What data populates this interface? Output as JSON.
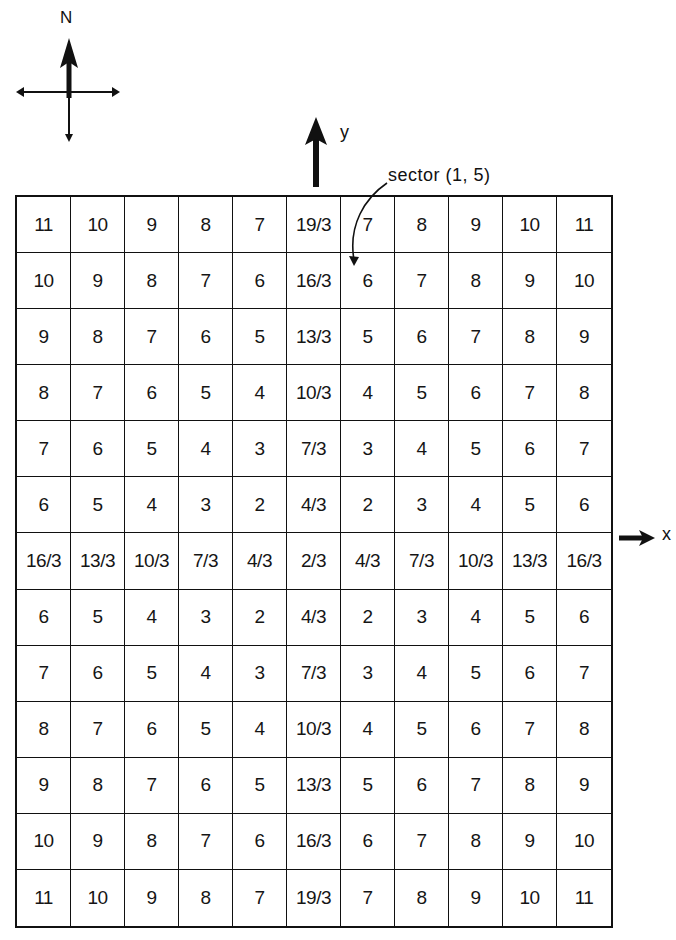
{
  "compass": {
    "north_label": "N"
  },
  "axes": {
    "y_label": "y",
    "x_label": "x"
  },
  "annotation": {
    "sector_label": "sector (1, 5)"
  },
  "grid": {
    "rows": 13,
    "cols": 11,
    "cells": [
      [
        "11",
        "10",
        "9",
        "8",
        "7",
        "19/3",
        "7",
        "8",
        "9",
        "10",
        "11"
      ],
      [
        "10",
        "9",
        "8",
        "7",
        "6",
        "16/3",
        "6",
        "7",
        "8",
        "9",
        "10"
      ],
      [
        "9",
        "8",
        "7",
        "6",
        "5",
        "13/3",
        "5",
        "6",
        "7",
        "8",
        "9"
      ],
      [
        "8",
        "7",
        "6",
        "5",
        "4",
        "10/3",
        "4",
        "5",
        "6",
        "7",
        "8"
      ],
      [
        "7",
        "6",
        "5",
        "4",
        "3",
        "7/3",
        "3",
        "4",
        "5",
        "6",
        "7"
      ],
      [
        "6",
        "5",
        "4",
        "3",
        "2",
        "4/3",
        "2",
        "3",
        "4",
        "5",
        "6"
      ],
      [
        "16/3",
        "13/3",
        "10/3",
        "7/3",
        "4/3",
        "2/3",
        "4/3",
        "7/3",
        "10/3",
        "13/3",
        "16/3"
      ],
      [
        "6",
        "5",
        "4",
        "3",
        "2",
        "4/3",
        "2",
        "3",
        "4",
        "5",
        "6"
      ],
      [
        "7",
        "6",
        "5",
        "4",
        "3",
        "7/3",
        "3",
        "4",
        "5",
        "6",
        "7"
      ],
      [
        "8",
        "7",
        "6",
        "5",
        "4",
        "10/3",
        "4",
        "5",
        "6",
        "7",
        "8"
      ],
      [
        "9",
        "8",
        "7",
        "6",
        "5",
        "13/3",
        "5",
        "6",
        "7",
        "8",
        "9"
      ],
      [
        "10",
        "9",
        "8",
        "7",
        "6",
        "16/3",
        "6",
        "7",
        "8",
        "9",
        "10"
      ],
      [
        "11",
        "10",
        "9",
        "8",
        "7",
        "19/3",
        "7",
        "8",
        "9",
        "10",
        "11"
      ]
    ]
  }
}
